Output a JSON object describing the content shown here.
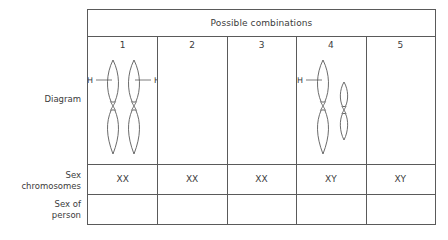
{
  "row_labels": {
    "diagram": "Diagram",
    "sex_chromosomes": "Sex\nchromosomes",
    "sex_of_person": "Sex of\nperson"
  },
  "table": {
    "header_title": "Possible combinations",
    "columns": [
      {
        "number": "1",
        "sex_chromosomes": "XX",
        "sex_of_person": "",
        "diagram": {
          "shapes": [
            {
              "kind": "x-chromosome",
              "label": "H",
              "label_side": "left"
            },
            {
              "kind": "x-chromosome",
              "label": "H",
              "label_side": "right"
            }
          ]
        }
      },
      {
        "number": "2",
        "sex_chromosomes": "XX",
        "sex_of_person": "",
        "diagram": {
          "shapes": []
        }
      },
      {
        "number": "3",
        "sex_chromosomes": "XX",
        "sex_of_person": "",
        "diagram": {
          "shapes": []
        }
      },
      {
        "number": "4",
        "sex_chromosomes": "XY",
        "sex_of_person": "",
        "diagram": {
          "shapes": [
            {
              "kind": "x-chromosome",
              "label": "H",
              "label_side": "left"
            },
            {
              "kind": "y-chromosome",
              "label": "",
              "label_side": ""
            }
          ]
        }
      },
      {
        "number": "5",
        "sex_chromosomes": "XY",
        "sex_of_person": "",
        "diagram": {
          "shapes": []
        }
      }
    ]
  },
  "colors": {
    "line": "#5a5a5a",
    "text": "#3b3b3b",
    "background": "#ffffff"
  }
}
